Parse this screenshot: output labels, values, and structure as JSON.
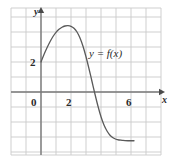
{
  "figure": {
    "name": "graph-of-f",
    "background": "#ffffff",
    "grid_color": "#c9c9c9",
    "axis_color": "#7a7a7a",
    "curve_color": "#5a5a5a",
    "text_color": "#2b2b2b"
  },
  "labels": {
    "y_axis": "y",
    "x_axis": "x",
    "curve": "y = f(x)",
    "origin": "0",
    "x_tick_2": "2",
    "x_tick_6": "6",
    "y_tick_2": "2"
  },
  "chart_data": {
    "type": "line",
    "title": "",
    "xlabel": "x",
    "ylabel": "y",
    "series_name": "y = f(x)",
    "grid": true,
    "grid_step": 1,
    "legend": "none",
    "xlim": [
      -2,
      8
    ],
    "ylim": [
      -5.6,
      5.6
    ],
    "x_ticks": [
      0,
      2,
      6
    ],
    "y_ticks": [
      2
    ],
    "x": [
      0.0,
      0.2,
      0.4,
      0.6,
      0.8,
      1.0,
      1.2,
      1.4,
      1.6,
      1.8,
      2.0,
      2.2,
      2.4,
      2.6,
      2.8,
      3.0,
      3.2,
      3.4,
      3.6,
      3.8,
      4.0,
      4.2,
      4.4,
      4.6,
      4.8,
      5.0,
      5.2,
      5.4,
      5.6,
      5.8,
      6.0,
      6.2
    ],
    "y": [
      2.0,
      2.5,
      2.95,
      3.35,
      3.7,
      3.98,
      4.18,
      4.32,
      4.4,
      4.42,
      4.38,
      4.25,
      4.0,
      3.6,
      3.05,
      2.35,
      1.55,
      0.7,
      -0.15,
      -0.95,
      -1.65,
      -2.2,
      -2.6,
      -2.88,
      -3.05,
      -3.15,
      -3.2,
      -3.22,
      -3.24,
      -3.25,
      -3.25,
      -3.25
    ],
    "annotations": [
      {
        "text": "y = f(x)",
        "x": 4.2,
        "y": 2.6
      }
    ],
    "notes": {
      "y_intercept": 2,
      "local_maximum": {
        "x": 1.8,
        "y": 4.42
      },
      "x_intercept_approx": 3.65,
      "right_asymptote_value": -3.25
    }
  }
}
